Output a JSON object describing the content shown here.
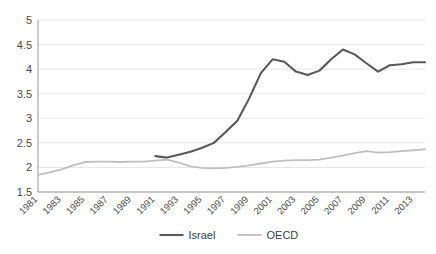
{
  "chart_data": {
    "type": "line",
    "title": "",
    "subtitle": "",
    "xlabel": "",
    "ylabel": "",
    "ylim": [
      1.5,
      5
    ],
    "yticks": [
      1.5,
      2,
      2.5,
      3,
      3.5,
      4,
      4.5,
      5
    ],
    "ytick_labels": [
      "1.5",
      "2",
      "2.5",
      "3",
      "3.5",
      "4",
      "4.5",
      "5"
    ],
    "xlim": [
      1981,
      2014
    ],
    "xticks": [
      1981,
      1983,
      1985,
      1987,
      1989,
      1991,
      1993,
      1995,
      1997,
      1999,
      2001,
      2003,
      2005,
      2007,
      2009,
      2011,
      2013
    ],
    "xtick_labels": [
      "1981",
      "1983",
      "1985",
      "1987",
      "1989",
      "1991",
      "1993",
      "1995",
      "1997",
      "1999",
      "2001",
      "2003",
      "2005",
      "2007",
      "2009",
      "2011",
      "2013"
    ],
    "grid": true,
    "grid_axis": "y",
    "legend_position": "bottom",
    "series": [
      {
        "name": "Israel",
        "color": "#595959",
        "x": [
          1991,
          1992,
          1993,
          1994,
          1995,
          1996,
          1997,
          1998,
          1999,
          2000,
          2001,
          2002,
          2003,
          2004,
          2005,
          2006,
          2007,
          2008,
          2009,
          2010,
          2011,
          2012,
          2013,
          2014
        ],
        "values": [
          2.23,
          2.2,
          2.26,
          2.32,
          2.4,
          2.5,
          2.72,
          2.95,
          3.4,
          3.92,
          4.2,
          4.15,
          3.95,
          3.88,
          3.97,
          4.2,
          4.4,
          4.3,
          4.12,
          3.95,
          4.08,
          4.1,
          4.14,
          4.14
        ]
      },
      {
        "name": "OECD",
        "color": "#bfbfbf",
        "x": [
          1981,
          1982,
          1983,
          1984,
          1985,
          1986,
          1987,
          1988,
          1989,
          1990,
          1991,
          1992,
          1993,
          1994,
          1995,
          1996,
          1997,
          1998,
          1999,
          2000,
          2001,
          2002,
          2003,
          2004,
          2005,
          2006,
          2007,
          2008,
          2009,
          2010,
          2011,
          2012,
          2013,
          2014
        ],
        "values": [
          1.85,
          1.9,
          1.96,
          2.04,
          2.11,
          2.12,
          2.12,
          2.11,
          2.12,
          2.12,
          2.14,
          2.16,
          2.1,
          2.02,
          1.99,
          1.98,
          1.99,
          2.01,
          2.04,
          2.08,
          2.12,
          2.14,
          2.15,
          2.15,
          2.16,
          2.2,
          2.24,
          2.29,
          2.33,
          2.3,
          2.31,
          2.33,
          2.35,
          2.37
        ]
      }
    ],
    "legend": [
      {
        "label": "Israel",
        "color": "#595959"
      },
      {
        "label": "OECD",
        "color": "#bfbfbf"
      }
    ],
    "axis_color": "#9a9a9a",
    "grid_color": "#e6e6e6",
    "background": "#ffffff"
  }
}
